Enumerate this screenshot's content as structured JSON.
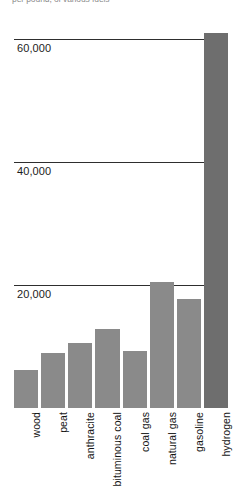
{
  "caption": {
    "fragment_text": "per pound, of various fuels"
  },
  "chart_data": {
    "type": "bar",
    "title": "",
    "subtitle": "",
    "xlabel": "",
    "ylabel": "",
    "ylim": [
      0,
      64000
    ],
    "grid": true,
    "grid_axis": "y",
    "legend": "none",
    "yticks": [
      20000,
      40000,
      60000
    ],
    "ytick_labels": [
      "20,000",
      "40,000",
      "60,000"
    ],
    "categories": [
      "wood",
      "peat",
      "anthracite",
      "bituminous coal",
      "coal gas",
      "natural gas",
      "gasoline",
      "hydrogen"
    ],
    "values": [
      6200,
      9000,
      10500,
      12800,
      9300,
      20500,
      17800,
      61000
    ],
    "bar_colors": [
      "#8a8a8a",
      "#8a8a8a",
      "#8a8a8a",
      "#8a8a8a",
      "#8a8a8a",
      "#8a8a8a",
      "#8a8a8a",
      "#6e6e6e"
    ],
    "highlight_index": 7,
    "axis_color": "#2e2e2e",
    "background": "#ffffff"
  }
}
